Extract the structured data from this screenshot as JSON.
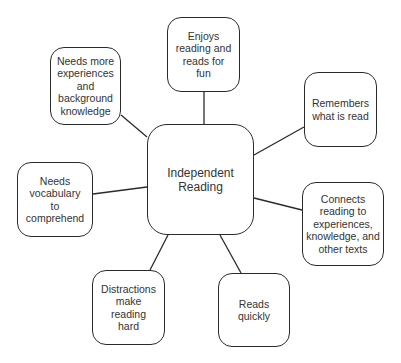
{
  "diagram": {
    "type": "concept-web",
    "center": {
      "label": "Independent\nReading"
    },
    "nodes": [
      {
        "id": "enjoys",
        "label": "Enjoys\nreading and\nreads for\nfun"
      },
      {
        "id": "remembers",
        "label": "Remembers\nwhat is read"
      },
      {
        "id": "connects",
        "label": "Connects\nreading to\nexperiences,\nknowledge, and\nother texts"
      },
      {
        "id": "reads-quickly",
        "label": "Reads\nquickly"
      },
      {
        "id": "distractions",
        "label": "Distractions\nmake\nreading\nhard"
      },
      {
        "id": "vocabulary",
        "label": "Needs\nvocabulary\nto\ncomprehend"
      },
      {
        "id": "experiences",
        "label": "Needs more\nexperiences\nand\nbackground\nknowledge"
      }
    ],
    "colors": {
      "stroke": "#2a2a2a",
      "text": "#333333",
      "background": "#ffffff"
    }
  }
}
